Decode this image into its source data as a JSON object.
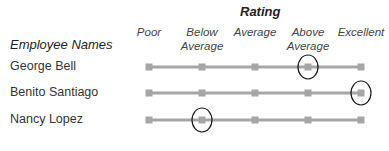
{
  "chart_data": {
    "type": "table",
    "title": "Rating",
    "row_header": "Employee Names",
    "categories": [
      "Poor",
      "Below Average",
      "Average",
      "Above Average",
      "Excellent"
    ],
    "category_lines": [
      [
        "Poor"
      ],
      [
        "Below",
        "Average"
      ],
      [
        "Average"
      ],
      [
        "Above",
        "Average"
      ],
      [
        "Excellent"
      ]
    ],
    "rows": [
      {
        "name": "George Bell",
        "rating": "Above Average",
        "rating_index": 3
      },
      {
        "name": "Benito Santiago",
        "rating": "Excellent",
        "rating_index": 4
      },
      {
        "name": "Nancy Lopez",
        "rating": "Below Average",
        "rating_index": 1
      }
    ],
    "colors": {
      "line": "#a6a6a6",
      "marker": "#a6a6a6",
      "circle": "#1a1a1a"
    }
  }
}
